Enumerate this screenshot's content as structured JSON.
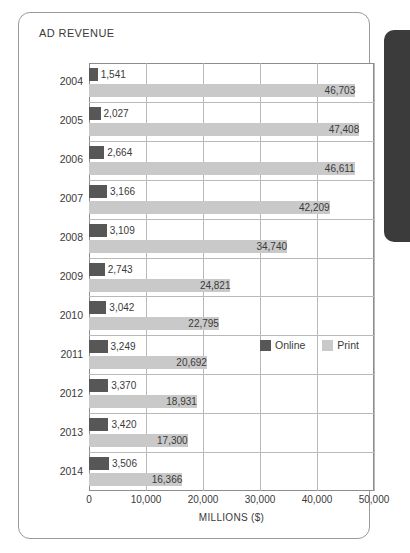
{
  "card": {
    "title": "AD REVENUE"
  },
  "legend": {
    "position": "inside-plot-right",
    "items": [
      {
        "label": "Online",
        "color": "#575757"
      },
      {
        "label": "Print",
        "color": "#c9c9c9"
      }
    ]
  },
  "axis": {
    "xlabel": "MILLIONS ($)",
    "ticks": [
      "0",
      "10,000",
      "20,000",
      "30,000",
      "40,000",
      "50,000"
    ]
  },
  "chart_data": {
    "type": "bar",
    "orientation": "horizontal",
    "title": "AD REVENUE",
    "xlabel": "MILLIONS ($)",
    "ylabel": "",
    "xlim": [
      0,
      50000
    ],
    "xticks": [
      0,
      10000,
      20000,
      30000,
      40000,
      50000
    ],
    "grid": true,
    "legend_position": "inside-plot-right",
    "categories": [
      "2004",
      "2005",
      "2006",
      "2007",
      "2008",
      "2009",
      "2010",
      "2011",
      "2012",
      "2013",
      "2014"
    ],
    "series": [
      {
        "name": "Online",
        "color": "#575757",
        "values": [
          1541,
          2027,
          2664,
          3166,
          3109,
          2743,
          3042,
          3249,
          3370,
          3420,
          3506
        ],
        "labels": [
          "1,541",
          "2,027",
          "2,664",
          "3,166",
          "3,109",
          "2,743",
          "3,042",
          "3,249",
          "3,370",
          "3,420",
          "3,506"
        ]
      },
      {
        "name": "Print",
        "color": "#c9c9c9",
        "values": [
          46703,
          47408,
          46611,
          42209,
          34740,
          24821,
          22795,
          20692,
          18931,
          17300,
          16366
        ],
        "labels": [
          "46,703",
          "47,408",
          "46,611",
          "42,209",
          "34,740",
          "24,821",
          "22,795",
          "20,692",
          "18,931",
          "17,300",
          "16,366"
        ]
      }
    ]
  }
}
